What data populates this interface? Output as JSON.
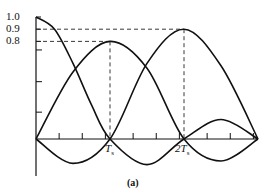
{
  "chart_data": {
    "type": "line",
    "title": "",
    "caption": "(a)",
    "xlabel": "",
    "ylabel": "",
    "x_tick_labels": [
      {
        "label": "T",
        "sub": "s",
        "x": 1
      },
      {
        "label": "2T",
        "sub": "s",
        "x": 2
      }
    ],
    "y_tick_labels": [
      "1.0",
      "0.9",
      "0.8"
    ],
    "y_ticks_unlabeled": [
      0.73,
      0.47,
      0.22
    ],
    "xlim": [
      0,
      3
    ],
    "ylim": [
      -0.25,
      1.0
    ],
    "grid": false,
    "reference_lines": [
      {
        "type": "dashed",
        "from": [
          0,
          0.9
        ],
        "to": [
          2,
          0.9
        ]
      },
      {
        "type": "dashed",
        "from": [
          0,
          0.8
        ],
        "to": [
          1,
          0.8
        ]
      },
      {
        "type": "dashed",
        "from": [
          1,
          0.8
        ],
        "to": [
          1,
          0
        ]
      },
      {
        "type": "dashed",
        "from": [
          2,
          0.9
        ],
        "to": [
          2,
          0
        ]
      }
    ],
    "series": [
      {
        "name": "curve-1",
        "x": [
          0,
          0.25,
          0.5,
          0.75,
          1,
          1.5,
          2,
          2.5,
          3
        ],
        "values": [
          1.0,
          0.9,
          0.62,
          0.28,
          0.0,
          -0.21,
          0.0,
          0.16,
          0.0
        ]
      },
      {
        "name": "curve-2",
        "x": [
          0,
          0.5,
          1,
          1.5,
          2,
          2.5,
          3
        ],
        "values": [
          0.0,
          0.55,
          0.8,
          0.58,
          0.0,
          -0.18,
          0.0
        ]
      },
      {
        "name": "curve-3",
        "x": [
          0,
          0.5,
          1,
          1.5,
          2,
          2.5,
          3
        ],
        "values": [
          0.0,
          -0.2,
          0.0,
          0.62,
          0.9,
          0.6,
          0.0
        ]
      }
    ]
  }
}
